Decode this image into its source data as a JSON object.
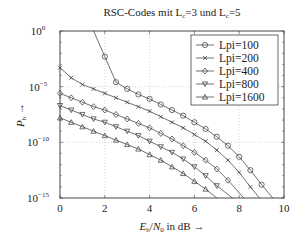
{
  "chart_data": {
    "type": "line",
    "title_parts": {
      "pre": "RSC-Codes mit L",
      "sub1": "c",
      "mid": "=3 und L",
      "sub2": "c",
      "post": "=5"
    },
    "xlabel": "E_b/N_0 in dB →",
    "xlabel_parts": {
      "e": "E",
      "esub": "b",
      "slash": "/",
      "n": "N",
      "nsub": "0",
      "rest": " in dB →"
    },
    "ylabel": "P_b →",
    "ylabel_parts": {
      "p": "P",
      "psub": "b",
      "arrow": " →"
    },
    "xlim": [
      0,
      10
    ],
    "ylim": [
      1e-15,
      1
    ],
    "yscale": "log",
    "xticks": [
      "0",
      "2",
      "4",
      "6",
      "8",
      "10"
    ],
    "yticks": [
      {
        "base": "10",
        "exp": "0"
      },
      {
        "base": "10",
        "exp": "−5"
      },
      {
        "base": "10",
        "exp": "−10"
      },
      {
        "base": "10",
        "exp": "−15"
      }
    ],
    "grid": true,
    "legend_position": "upper right",
    "series": [
      {
        "name": "Lpi=100",
        "marker": "circle",
        "x": [
          1.5,
          2.0,
          2.5,
          3.0,
          3.5,
          4.0,
          4.5,
          5.0,
          5.5,
          6.0,
          6.5,
          7.0,
          7.5,
          8.0,
          8.5,
          9.0,
          9.5
        ],
        "log10_y": [
          0,
          -2.3,
          -4.6,
          -5.2,
          -5.7,
          -6.1,
          -6.6,
          -7.1,
          -7.6,
          -8.2,
          -8.8,
          -9.5,
          -10.3,
          -11.3,
          -12.5,
          -13.8,
          -15.0
        ]
      },
      {
        "name": "Lpi=200",
        "marker": "x",
        "x": [
          0,
          0.5,
          1.0,
          1.5,
          2.0,
          2.5,
          3.0,
          3.5,
          4.0,
          4.5,
          5.0,
          5.5,
          6.0,
          6.5,
          7.0,
          7.5,
          8.0,
          8.5,
          8.9
        ],
        "log10_y": [
          -3.3,
          -4.2,
          -4.8,
          -5.2,
          -5.6,
          -6.0,
          -6.4,
          -6.8,
          -7.2,
          -7.7,
          -8.2,
          -8.7,
          -9.3,
          -9.9,
          -10.7,
          -11.6,
          -12.7,
          -14.0,
          -15.0
        ]
      },
      {
        "name": "Lpi=400",
        "marker": "diamond",
        "x": [
          0,
          0.5,
          1.0,
          1.5,
          2.0,
          2.5,
          3.0,
          3.5,
          4.0,
          4.5,
          5.0,
          5.5,
          6.0,
          6.5,
          7.0,
          7.5,
          8.2
        ],
        "log10_y": [
          -5.6,
          -6.0,
          -6.4,
          -6.8,
          -7.1,
          -7.5,
          -7.9,
          -8.3,
          -8.7,
          -9.2,
          -9.7,
          -10.3,
          -10.9,
          -11.6,
          -12.4,
          -13.4,
          -15.0
        ]
      },
      {
        "name": "Lpi=800",
        "marker": "triangle-down",
        "x": [
          0,
          0.5,
          1.0,
          1.5,
          2.0,
          2.5,
          3.0,
          3.5,
          4.0,
          4.5,
          5.0,
          5.5,
          6.0,
          6.5,
          7.0,
          7.7
        ],
        "log10_y": [
          -6.7,
          -7.1,
          -7.5,
          -7.9,
          -8.2,
          -8.6,
          -9.0,
          -9.4,
          -9.9,
          -10.4,
          -10.9,
          -11.5,
          -12.2,
          -13.0,
          -13.9,
          -15.0
        ]
      },
      {
        "name": "Lpi=1600",
        "marker": "triangle-up",
        "x": [
          0,
          0.5,
          1.0,
          1.5,
          2.0,
          2.5,
          3.0,
          3.5,
          4.0,
          4.5,
          5.0,
          5.5,
          6.0,
          6.5,
          7.0
        ],
        "log10_y": [
          -7.8,
          -8.2,
          -8.6,
          -9.0,
          -9.4,
          -9.8,
          -10.2,
          -10.6,
          -11.1,
          -11.6,
          -12.2,
          -12.8,
          -13.5,
          -14.2,
          -15.0
        ]
      }
    ]
  }
}
